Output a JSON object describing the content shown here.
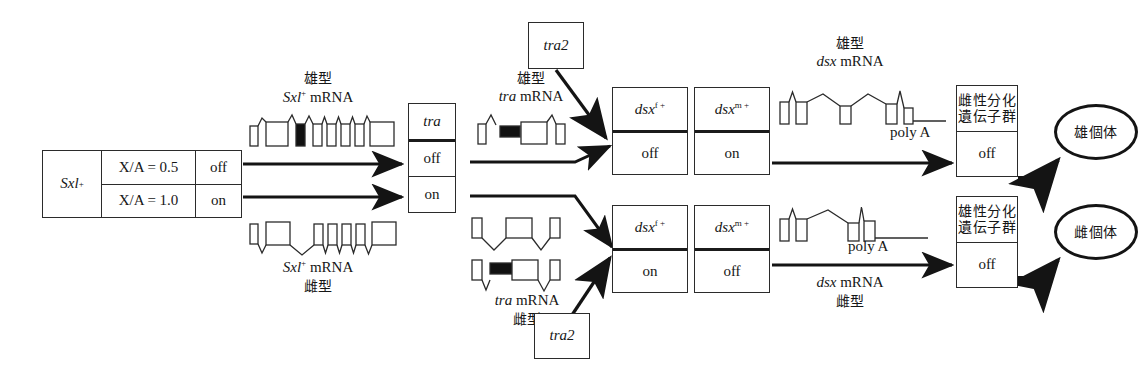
{
  "diagram": {
    "sxl_table": {
      "gene": "Sxl",
      "gene_sup": "+",
      "rows": [
        {
          "condition": "X/A = 0.5",
          "state": "off"
        },
        {
          "condition": "X/A = 1.0",
          "state": "on"
        }
      ]
    },
    "sxl_mrna_male": {
      "type_label": "雄型",
      "name": "Sxl",
      "name_sup": "+",
      "suffix": "mRNA"
    },
    "sxl_mrna_female": {
      "name": "Sxl",
      "name_sup": "+",
      "suffix": "mRNA",
      "type_label": "雌型"
    },
    "tra_box": {
      "gene": "tra",
      "male_state": "off",
      "female_state": "on"
    },
    "tra2_top": {
      "label": "tra2"
    },
    "tra2_bottom": {
      "label": "tra2"
    },
    "tra_mrna_male": {
      "type_label": "雄型",
      "name": "tra",
      "suffix": "mRNA"
    },
    "tra_mrna_female": {
      "name": "tra",
      "suffix": "mRNA",
      "type_label": "雌型"
    },
    "dsx_male_row": {
      "female_gene": "dsx",
      "female_sup": "f +",
      "female_state": "off",
      "male_gene": "dsx",
      "male_sup": "m +",
      "male_state": "on"
    },
    "dsx_female_row": {
      "female_gene": "dsx",
      "female_sup": "f +",
      "female_state": "on",
      "male_gene": "dsx",
      "male_sup": "m +",
      "male_state": "off"
    },
    "dsx_mrna_male": {
      "type_label": "雄型",
      "name": "dsx",
      "suffix": "mRNA",
      "polya": "poly A"
    },
    "dsx_mrna_female": {
      "polya": "poly A",
      "name": "dsx",
      "suffix": "mRNA",
      "type_label": "雌型"
    },
    "outcome_male": {
      "gene_group_line1": "雌性分化",
      "gene_group_line2": "遺伝子群",
      "state": "off",
      "individual": "雄個体"
    },
    "outcome_female": {
      "gene_group_line1": "雄性分化",
      "gene_group_line2": "遺伝子群",
      "state": "off",
      "individual": "雌個体"
    }
  },
  "colors": {
    "ink": "#1a1a1a",
    "line": "#2b2b2b",
    "exon_fill": "#ffffff",
    "exon_black": "#111111",
    "background": "#ffffff"
  }
}
